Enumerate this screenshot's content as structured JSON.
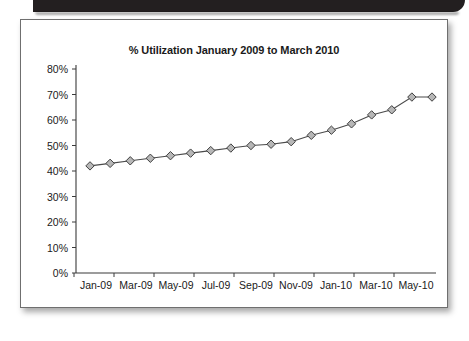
{
  "page": {
    "header_band_color": "#231f20",
    "card_border_color": "#6f6f6f",
    "background": "#ffffff"
  },
  "chart_data": {
    "type": "line",
    "title": "% Utilization January 2009 to March 2010",
    "xlabel": "",
    "ylabel": "",
    "ylim": [
      0,
      80
    ],
    "grid": false,
    "legend": null,
    "marker": "diamond",
    "marker_fill": "#b7b7b7",
    "marker_edge": "#3f3f3f",
    "line_color": "#4a4a4a",
    "ytick_labels": [
      "0%",
      "10%",
      "20%",
      "30%",
      "40%",
      "50%",
      "60%",
      "70%",
      "80%"
    ],
    "ytick_values": [
      0,
      10,
      20,
      30,
      40,
      50,
      60,
      70,
      80
    ],
    "categories": [
      "Jan-09",
      "Feb-09",
      "Mar-09",
      "Apr-09",
      "May-09",
      "Jun-09",
      "Jul-09",
      "Aug-09",
      "Sep-09",
      "Oct-09",
      "Nov-09",
      "Dec-09",
      "Jan-10",
      "Feb-10",
      "Mar-10",
      "Apr-10",
      "May-10",
      "Jun-10"
    ],
    "xtick_labels": [
      "Jan-09",
      "Mar-09",
      "May-09",
      "Jul-09",
      "Sep-09",
      "Nov-09",
      "Jan-10",
      "Mar-10",
      "May-10"
    ],
    "values": [
      42,
      43,
      44,
      45,
      46,
      47,
      48,
      49,
      50,
      50.5,
      51.5,
      54,
      56,
      58.5,
      62,
      64,
      69,
      69
    ]
  }
}
